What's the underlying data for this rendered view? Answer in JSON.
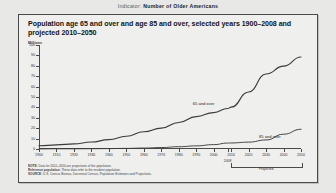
{
  "header": {
    "label": "Indicator:",
    "value": "Number of Older Americans"
  },
  "panel": {
    "title": "Population age 65 and over and age 85 and over, selected years 1900–2008 and projected 2010–2050",
    "notes": [
      {
        "key": "NOTE:",
        "text": " Data for 2010–2050 are projections of the population."
      },
      {
        "key": "Reference population:",
        "text": " These data refer to the resident population."
      },
      {
        "key": "SOURCE:",
        "text": " U.S. Census Bureau, Decennial Census, Population Estimates and Projections."
      }
    ]
  },
  "chart_data": {
    "type": "line",
    "title": "Population age 65 and over and age 85 and over, selected years 1900–2008 and projected 2010–2050",
    "xlabel": "",
    "ylabel": "Millions",
    "ylim": [
      0,
      100
    ],
    "xlim": [
      1900,
      2050
    ],
    "ytick_labels": [
      "0",
      "10",
      "20",
      "30",
      "40",
      "50",
      "60",
      "70",
      "80",
      "90",
      "100"
    ],
    "ytick_values": [
      0,
      10,
      20,
      30,
      40,
      50,
      60,
      70,
      80,
      90,
      100
    ],
    "xtick_labels": [
      "1900",
      "1910",
      "1920",
      "1930",
      "1940",
      "1950",
      "1960",
      "1970",
      "1980",
      "1990",
      "2000",
      "2010",
      "2020",
      "2030",
      "2040",
      "2050"
    ],
    "xtick_values": [
      1900,
      1910,
      1920,
      1930,
      1940,
      1950,
      1960,
      1970,
      1980,
      1990,
      2000,
      2010,
      2020,
      2030,
      2040,
      2050
    ],
    "extra_xtick": {
      "label": "2008",
      "value": 2008
    },
    "grid": false,
    "legend_position": "inline-annotations",
    "annotations": [
      {
        "text": "65 and over",
        "x": 1988,
        "y": 46
      },
      {
        "text": "85 and over",
        "x": 2026,
        "y": 14
      }
    ],
    "projection_bracket": {
      "label": "Projected",
      "from": 2010,
      "to": 2050
    },
    "series": [
      {
        "name": "65 and over",
        "x": [
          1900,
          1910,
          1920,
          1930,
          1940,
          1950,
          1960,
          1970,
          1980,
          1990,
          2000,
          2008,
          2010,
          2020,
          2030,
          2040,
          2050
        ],
        "values": [
          3.1,
          4.0,
          4.9,
          6.7,
          9.0,
          12.3,
          16.6,
          20.1,
          25.5,
          31.2,
          35.0,
          38.9,
          40.2,
          54.8,
          72.1,
          79.7,
          88.5
        ]
      },
      {
        "name": "85 and over",
        "x": [
          1900,
          1910,
          1920,
          1930,
          1940,
          1950,
          1960,
          1970,
          1980,
          1990,
          2000,
          2008,
          2010,
          2020,
          2030,
          2040,
          2050
        ],
        "values": [
          0.1,
          0.2,
          0.2,
          0.3,
          0.4,
          0.6,
          0.9,
          1.4,
          2.2,
          3.0,
          4.2,
          5.7,
          5.8,
          6.6,
          8.7,
          14.2,
          19.0
        ]
      }
    ]
  }
}
